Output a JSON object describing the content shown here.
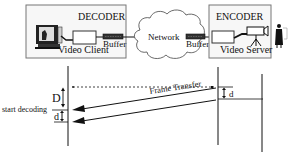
{
  "decoder": {
    "title": "DECODER",
    "caption": "Video Client",
    "buffer_label": "Buffer"
  },
  "network": {
    "label": "Network"
  },
  "encoder": {
    "title": "ENCODER",
    "caption": "Video Server",
    "buffer_label": "Buffer"
  },
  "timing": {
    "transfer_label": "Frame Transfer",
    "delay_big_label": "D",
    "delay_small_label_left": "d",
    "delay_small_label_right": "d",
    "start_label": "start decoding"
  },
  "colors": {
    "ink": "#111111",
    "box_border": "#555555",
    "buffer_fill": "#333333",
    "background": "#ffffff"
  }
}
